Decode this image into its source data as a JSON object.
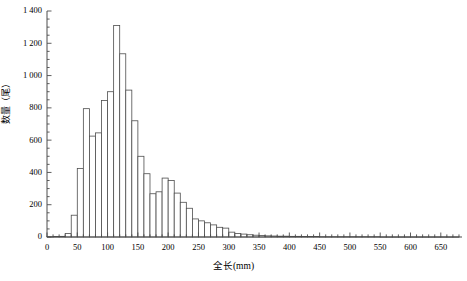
{
  "chart_data": {
    "type": "bar",
    "title": "",
    "subtitle": "",
    "xlabel": "全长(mm)",
    "ylabel": "数量（尾）",
    "xlim": [
      0,
      685
    ],
    "ylim": [
      0,
      1400
    ],
    "grid": false,
    "legend": null,
    "bin_width": 10,
    "x_major_ticks": [
      0,
      50,
      100,
      150,
      200,
      250,
      300,
      350,
      400,
      450,
      500,
      550,
      600,
      650
    ],
    "x_major_tick_labels": [
      "0",
      "50",
      "100",
      "150",
      "200",
      "250",
      "300",
      "350",
      "400",
      "450",
      "500",
      "550",
      "600",
      "650"
    ],
    "x_minor_tick_step": 10,
    "y_major_ticks": [
      0,
      200,
      400,
      600,
      800,
      1000,
      1200,
      1400
    ],
    "y_major_tick_labels": [
      "0",
      "200",
      "400",
      "600",
      "800",
      "1 000",
      "1 200",
      "1 400"
    ],
    "categories": [
      "10",
      "20",
      "30",
      "40",
      "50",
      "60",
      "70",
      "80",
      "90",
      "100",
      "110",
      "120",
      "130",
      "140",
      "150",
      "160",
      "170",
      "180",
      "190",
      "200",
      "210",
      "220",
      "230",
      "240",
      "250",
      "260",
      "270",
      "280",
      "290",
      "300",
      "310",
      "320",
      "330",
      "340",
      "350",
      "360",
      "370",
      "380",
      "390",
      "400",
      "410",
      "420",
      "430",
      "440",
      "450",
      "460",
      "470",
      "480",
      "490",
      "500",
      "510",
      "520",
      "530",
      "540",
      "550",
      "560",
      "570",
      "580",
      "590",
      "600",
      "610",
      "620",
      "630",
      "640",
      "650",
      "660",
      "670",
      "680"
    ],
    "values": [
      2,
      3,
      4,
      22,
      135,
      425,
      795,
      625,
      645,
      845,
      900,
      1310,
      1135,
      910,
      720,
      500,
      392,
      268,
      280,
      365,
      350,
      272,
      215,
      178,
      112,
      100,
      88,
      75,
      60,
      55,
      30,
      22,
      18,
      14,
      11,
      9,
      7,
      6,
      5,
      5,
      4,
      4,
      3,
      3,
      3,
      2,
      2,
      2,
      2,
      2,
      2,
      2,
      2,
      2,
      2,
      1,
      1,
      1,
      1,
      1,
      1,
      1,
      1,
      1,
      1,
      1,
      1,
      1
    ],
    "bar_style": {
      "fill": "#ffffff",
      "stroke": "#4d4d4d",
      "stroke_width": 0.8
    },
    "axis_color": "#4d4d4d"
  }
}
